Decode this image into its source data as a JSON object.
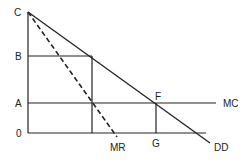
{
  "diagram": {
    "labels": {
      "c": "C",
      "b": "B",
      "a": "A",
      "origin": "0",
      "f": "F",
      "g": "G",
      "mc": "MC",
      "mr": "MR",
      "dd": "DD"
    },
    "curves": [
      {
        "name": "DD",
        "style": "solid",
        "description": "demand curve"
      },
      {
        "name": "MR",
        "style": "dashed",
        "description": "marginal revenue curve"
      },
      {
        "name": "MC",
        "style": "solid",
        "description": "marginal cost (horizontal)"
      }
    ],
    "colors": {
      "line": "#222222",
      "background": "#ffffff"
    }
  }
}
